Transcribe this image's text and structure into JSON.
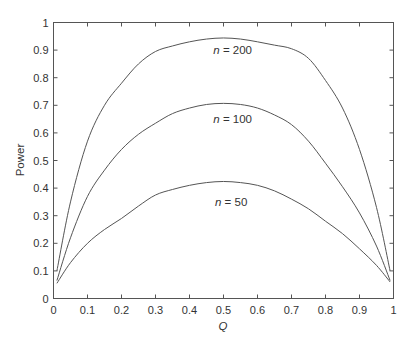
{
  "chart_data": {
    "type": "line",
    "title": "",
    "xlabel": "Q",
    "ylabel": "Power",
    "xlim": [
      0,
      1
    ],
    "ylim": [
      0,
      1
    ],
    "grid": false,
    "legend": "inline labels",
    "x_ticks": [
      "0",
      "0.1",
      "0.2",
      "0.3",
      "0.4",
      "0.5",
      "0.6",
      "0.7",
      "0.8",
      "0.9",
      "1"
    ],
    "y_ticks": [
      "0",
      "0.1",
      "0.2",
      "0.3",
      "0.4",
      "0.5",
      "0.6",
      "0.7",
      "0.8",
      "0.9",
      "1"
    ],
    "x": [
      0.01,
      0.05,
      0.1,
      0.15,
      0.2,
      0.25,
      0.3,
      0.35,
      0.4,
      0.45,
      0.5,
      0.55,
      0.6,
      0.65,
      0.7,
      0.75,
      0.8,
      0.85,
      0.9,
      0.95,
      0.99
    ],
    "series": [
      {
        "name": "n = 200",
        "label": {
          "prefix": "n",
          "rest": " = 200",
          "x": 0.47,
          "y": 0.885
        },
        "values": [
          0.1,
          0.35,
          0.57,
          0.7,
          0.78,
          0.85,
          0.895,
          0.915,
          0.93,
          0.94,
          0.944,
          0.94,
          0.93,
          0.918,
          0.905,
          0.87,
          0.79,
          0.69,
          0.54,
          0.33,
          0.1
        ]
      },
      {
        "name": "n = 100",
        "label": {
          "prefix": "n",
          "rest": " = 100",
          "x": 0.47,
          "y": 0.635
        },
        "values": [
          0.065,
          0.22,
          0.37,
          0.465,
          0.54,
          0.595,
          0.635,
          0.67,
          0.69,
          0.703,
          0.707,
          0.703,
          0.69,
          0.665,
          0.63,
          0.57,
          0.49,
          0.405,
          0.31,
          0.19,
          0.065
        ]
      },
      {
        "name": "n = 50",
        "label": {
          "prefix": "n",
          "rest": " = 50",
          "x": 0.475,
          "y": 0.335
        },
        "values": [
          0.055,
          0.13,
          0.2,
          0.25,
          0.29,
          0.335,
          0.375,
          0.395,
          0.41,
          0.42,
          0.424,
          0.42,
          0.41,
          0.39,
          0.36,
          0.325,
          0.28,
          0.235,
          0.18,
          0.12,
          0.06
        ]
      }
    ]
  },
  "axes": {
    "x_label": "Q",
    "y_label": "Power"
  }
}
